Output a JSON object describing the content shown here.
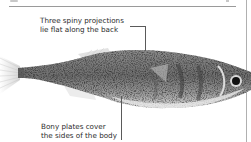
{
  "annotations": {
    "top": {
      "line1": "Three spiny projections",
      "line2": "lie flat along the back"
    },
    "bottom": {
      "line1": "Bony plates cover",
      "line2": "the sides of the body"
    }
  },
  "image": {
    "subject": "stickleback-fish",
    "palette": [
      "#ffffff",
      "#d9d9d9",
      "#8c8c8c",
      "#3a3a3a",
      "#111111"
    ]
  }
}
